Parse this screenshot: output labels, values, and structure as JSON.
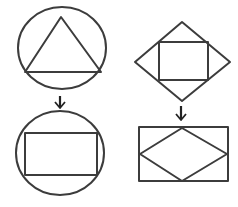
{
  "diagram": {
    "title": "",
    "stroke_color": "#3c3c3c",
    "arrow_color": "#222222",
    "background": "#ffffff",
    "panels": [
      {
        "id": "left",
        "before": {
          "outer": "circle",
          "inner": "triangle"
        },
        "after": {
          "outer": "circle",
          "inner": "rectangle"
        }
      },
      {
        "id": "right",
        "before": {
          "outer": "diamond",
          "inner": "rectangle"
        },
        "after": {
          "outer": "rectangle",
          "inner": "diamond"
        }
      }
    ],
    "arrows": [
      {
        "direction": "down",
        "icon": "arrow-down-icon"
      },
      {
        "direction": "down",
        "icon": "arrow-down-icon"
      }
    ]
  }
}
